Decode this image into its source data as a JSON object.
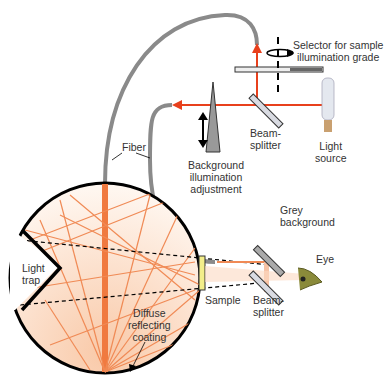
{
  "labels": {
    "selector": [
      "Selector for sample",
      "illumination grade"
    ],
    "beamsplitter_top": [
      "Beam-",
      "splitter"
    ],
    "light_source": [
      "Light",
      "source"
    ],
    "fiber": "Fiber",
    "background_adjust": [
      "Background",
      "illumination",
      "adjustment"
    ],
    "grey_background": [
      "Grey",
      "background"
    ],
    "eye": "Eye",
    "light_trap": [
      "Light",
      "trap"
    ],
    "sample": "Sample",
    "beamsplitter_bottom": [
      "Beam-",
      "splitter"
    ],
    "coating": [
      "Diffuse",
      "reflecting",
      "coating"
    ]
  },
  "colors": {
    "beam_red": "#e8401c",
    "ray_orange": "#f08a55",
    "fiber_grey": "#8a8a8a",
    "sphere_fill": "#fdeadb",
    "sample_yellow": "#f3ee8a"
  }
}
